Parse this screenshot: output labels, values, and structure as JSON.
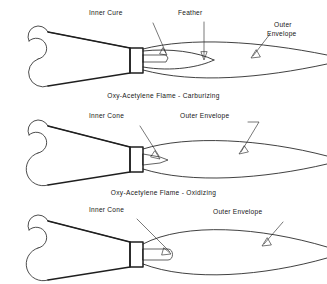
{
  "document": {
    "title": "Oxy-Acetylene Flame Types",
    "background_color": "#ffffff",
    "line_color": "#1f1f1f",
    "text_color": "#161616"
  },
  "figures": [
    {
      "id": "carburizing",
      "caption": "Oxy-Acetylene Flame - Carburizing",
      "labels": [
        {
          "name": "inner-cure",
          "text": "Inner Cure"
        },
        {
          "name": "feather",
          "text": "Feather"
        },
        {
          "name": "outer-envelope-line1",
          "text": "Outer"
        },
        {
          "name": "outer-envelope-line2",
          "text": "Envelope"
        }
      ]
    },
    {
      "id": "oxidizing",
      "caption": "Oxy-Acetylene Flame - Oxidizing",
      "labels": [
        {
          "name": "inner-cone",
          "text": "Inner Cone"
        },
        {
          "name": "outer-envelope",
          "text": "Outer Envelope"
        }
      ]
    },
    {
      "id": "neutral",
      "caption": "",
      "labels": [
        {
          "name": "inner-cone",
          "text": "Inner Cone"
        },
        {
          "name": "outer-envelope",
          "text": "Outer Envelope"
        }
      ]
    }
  ]
}
